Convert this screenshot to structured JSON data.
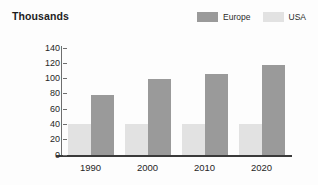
{
  "chart_data": {
    "type": "bar",
    "title": "Thousands",
    "xlabel": "",
    "ylabel": "",
    "categories": [
      "1990",
      "2000",
      "2010",
      "2020"
    ],
    "series": [
      {
        "name": "Europe",
        "color": "#9a9a9a",
        "values": [
          79,
          99,
          106,
          118
        ]
      },
      {
        "name": "USA",
        "color": "#e2e2e2",
        "values": [
          40,
          40,
          40,
          40
        ]
      }
    ],
    "ylim": [
      0,
      140
    ],
    "yticks": [
      "0",
      "20",
      "40",
      "60",
      "80",
      "100",
      "120",
      "140"
    ],
    "grid": false,
    "legend_position": "top-right",
    "series_order_in_group": [
      "USA",
      "Europe"
    ]
  },
  "colors": {
    "europe": "#9a9a9a",
    "usa": "#e2e2e2",
    "axis": "#3a3a3a",
    "tick": "#6e6e6e",
    "text": "#262626",
    "background": "#fdfdfd"
  }
}
